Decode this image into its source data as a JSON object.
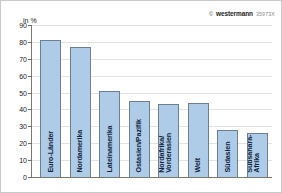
{
  "credit": {
    "copyright_symbol": "©",
    "brand": "westermann",
    "code": "35973X"
  },
  "axis": {
    "unit_label": "in %",
    "ticks": [
      "90",
      "80",
      "70",
      "60",
      "50",
      "40",
      "30",
      "20",
      "10",
      "0"
    ]
  },
  "colors": {
    "bar_fill": "#aecce8",
    "bar_stroke": "#6e7f92",
    "grid": "#e3e3e3",
    "axis": "#7a7a6a",
    "label_text": "#10243a"
  },
  "chart_data": {
    "type": "bar",
    "title": "",
    "xlabel": "",
    "ylabel": "in %",
    "ylim": [
      0,
      90
    ],
    "ytick_step": 10,
    "grid": true,
    "legend": "none",
    "categories": [
      "Euro-Länder",
      "Nordamerika",
      "Lateinamerika",
      "Ostasien/Pazifik",
      "Nordafrika/\nVorderasien",
      "Welt",
      "Südasien",
      "Subsahara-\nAfrika"
    ],
    "category_lines": [
      [
        "Euro-Länder"
      ],
      [
        "Nordamerika"
      ],
      [
        "Lateinamerika"
      ],
      [
        "Ostasien/Pazifik"
      ],
      [
        "Nordafrika/",
        "Vorderasien"
      ],
      [
        "Welt"
      ],
      [
        "Südasien"
      ],
      [
        "Subsahara-",
        "Afrika"
      ]
    ],
    "values": [
      81,
      77,
      51,
      45,
      43,
      44,
      28,
      26
    ]
  }
}
